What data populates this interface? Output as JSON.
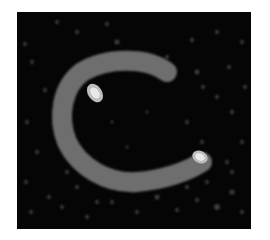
{
  "image": {
    "description": "Noisy grayscale intensity map showing a C-shaped ring with two bright hotspots",
    "colors": {
      "background": "#ffffff",
      "field": "#050505",
      "ring": "#6e6e6e",
      "hotspot_edge": "#bdbdbd",
      "hotspot_core": "#e8e8e8",
      "noise": "#3a3a3a"
    }
  }
}
